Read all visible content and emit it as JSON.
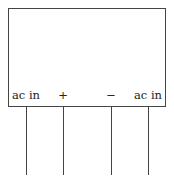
{
  "diagram": {
    "component": "bridge rectifier",
    "pins": [
      {
        "label": "ac in",
        "x": 26
      },
      {
        "label": "+",
        "x": 63
      },
      {
        "label": "−",
        "x": 111
      },
      {
        "label": "ac in",
        "x": 148
      }
    ]
  }
}
